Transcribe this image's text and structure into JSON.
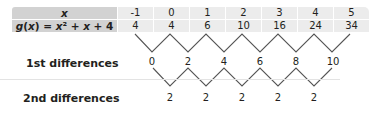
{
  "table": {
    "header": {
      "label": "x",
      "values": [
        "-1",
        "0",
        "1",
        "2",
        "3",
        "4",
        "5"
      ]
    },
    "function_row": {
      "label": "g(x) = x² + x + 4",
      "values": [
        "4",
        "4",
        "6",
        "10",
        "16",
        "24",
        "34"
      ]
    }
  },
  "first_differences": {
    "label": "1st differences",
    "values": [
      "0",
      "2",
      "4",
      "6",
      "8",
      "10"
    ]
  },
  "second_differences": {
    "label": "2nd differences",
    "values": [
      "2",
      "2",
      "2",
      "2",
      "2"
    ]
  },
  "colors": {
    "label_cell_bg": "#d2d2d2",
    "value_cell_bg": "#ececec",
    "line": "#555555"
  }
}
